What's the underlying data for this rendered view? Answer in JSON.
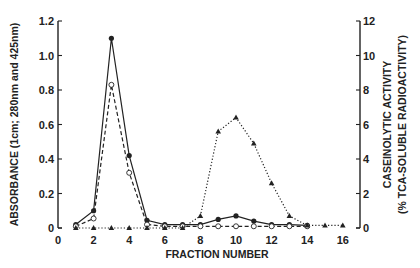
{
  "chart_data": {
    "type": "line",
    "title": "",
    "xlabel": "FRACTION NUMBER",
    "ylabel": "ABSORBANCE (1cm; 280nm and 425nm)",
    "y2label_line1": "CASEINOLYTIC ACTIVITY",
    "y2label_line2": "(% TCA-SOLUBLE RADIOACTIVITY)",
    "xlim": [
      0,
      16
    ],
    "ylim": [
      0,
      1.2
    ],
    "y2lim": [
      0,
      12
    ],
    "xticks": [
      "0",
      "2",
      "4",
      "6",
      "8",
      "10",
      "12",
      "14",
      "16"
    ],
    "yticks": [
      "0",
      "0.2",
      "0.4",
      "0.6",
      "0.8",
      "1.0",
      "1.2"
    ],
    "y2ticks": [
      "0",
      "2",
      "4",
      "6",
      "8",
      "10",
      "12"
    ],
    "grid": false,
    "legend": null,
    "series": [
      {
        "name": "Absorbance 280nm",
        "axis": "left",
        "marker": "filled-circle",
        "line": "solid",
        "x": [
          1,
          2,
          3,
          4,
          5,
          6,
          7,
          8,
          9,
          10,
          11,
          12,
          13,
          14
        ],
        "values": [
          0.02,
          0.1,
          1.1,
          0.42,
          0.045,
          0.02,
          0.02,
          0.02,
          0.05,
          0.07,
          0.04,
          0.02,
          0.02,
          0.015
        ]
      },
      {
        "name": "Absorbance 425nm",
        "axis": "left",
        "marker": "open-circle",
        "line": "dashed",
        "x": [
          1,
          2,
          3,
          4,
          5,
          6,
          7,
          8,
          9,
          10,
          11,
          12,
          13,
          14
        ],
        "values": [
          0.01,
          0.055,
          0.83,
          0.32,
          0.02,
          0.01,
          0.01,
          0.01,
          0.01,
          0.01,
          0.01,
          0.01,
          0.01,
          0.01
        ]
      },
      {
        "name": "Caseinolytic activity",
        "axis": "right",
        "marker": "filled-triangle",
        "line": "dotted",
        "x": [
          1,
          2,
          3,
          4,
          5,
          6,
          7,
          8,
          9,
          10,
          11,
          12,
          13,
          14,
          15,
          16
        ],
        "values": [
          0,
          0,
          0,
          0,
          0,
          0,
          0,
          0.7,
          5.6,
          6.4,
          4.9,
          2.6,
          0.7,
          0.15,
          0.15,
          0.15
        ]
      }
    ]
  }
}
